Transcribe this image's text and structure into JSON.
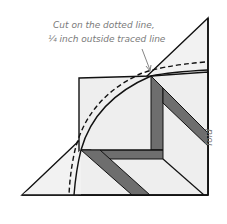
{
  "diagram": {
    "annotation": {
      "line1": "Cut on the dotted line,",
      "line2": "¼ inch outside traced line"
    },
    "side_label": "fold",
    "colors": {
      "paper": "#f2f2f2",
      "stroke": "#111111",
      "strip": "#6e6e6e",
      "caption": "#7a7a7a"
    }
  }
}
